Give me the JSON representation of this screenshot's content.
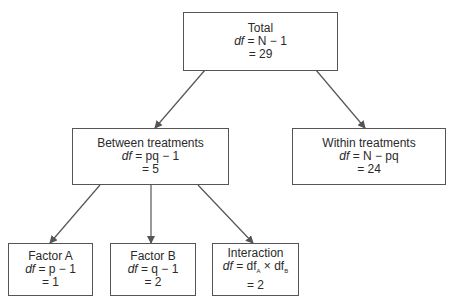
{
  "diagram": {
    "type": "tree",
    "nodes": {
      "total": {
        "title": "Total",
        "formula_lhs": "df",
        "formula_rhs": "= N − 1",
        "value": "= 29"
      },
      "between": {
        "title": "Between treatments",
        "formula_lhs": "df",
        "formula_rhs": "= pq − 1",
        "value": "= 5"
      },
      "within": {
        "title": "Within treatments",
        "formula_lhs": "df",
        "formula_rhs": "= N − pq",
        "value": "= 24"
      },
      "factor_a": {
        "title": "Factor A",
        "formula_lhs": "df",
        "formula_rhs": "= p − 1",
        "value": "= 1"
      },
      "factor_b": {
        "title": "Factor B",
        "formula_lhs": "df",
        "formula_rhs": "= q − 1",
        "value": "= 2"
      },
      "interaction": {
        "title": "Interaction",
        "formula_lhs": "df",
        "formula_rhs": "= df",
        "sub_a": "A",
        "times": " × df",
        "sub_b": "B",
        "value": "= 2"
      }
    },
    "edges": [
      [
        "total",
        "between"
      ],
      [
        "total",
        "within"
      ],
      [
        "between",
        "factor_a"
      ],
      [
        "between",
        "factor_b"
      ],
      [
        "between",
        "interaction"
      ]
    ],
    "line_color": "#555555"
  }
}
